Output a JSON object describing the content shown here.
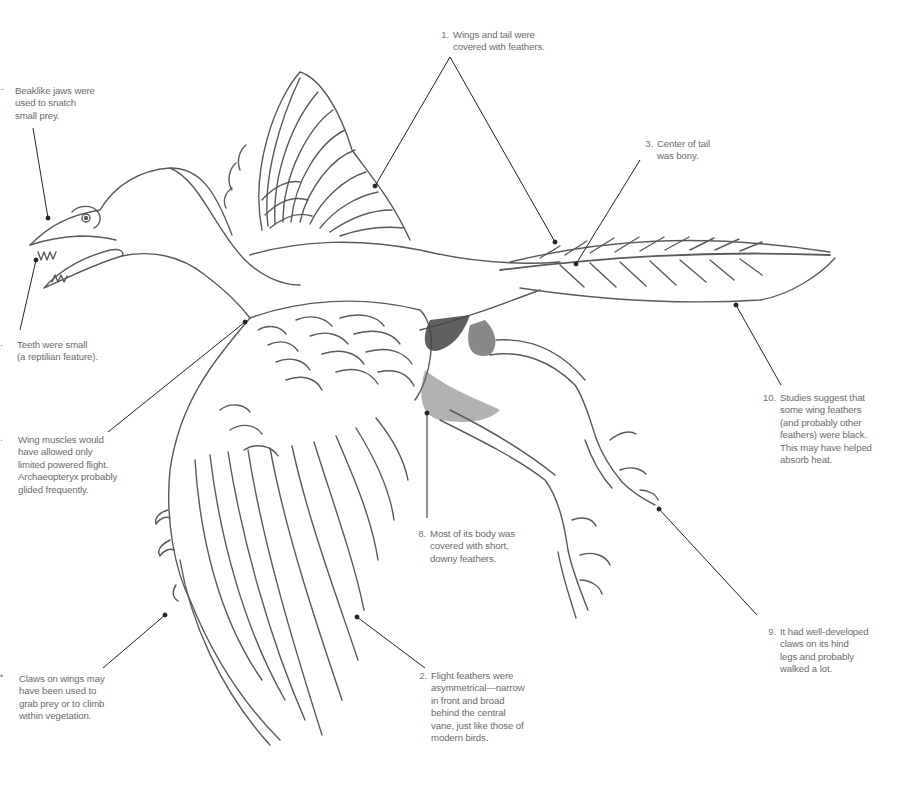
{
  "diagram": {
    "colors": {
      "background": "#ffffff",
      "text": "#6b6b6b",
      "leader_line": "#222222",
      "pencil": "#555555"
    },
    "annotations": [
      {
        "id": "a1",
        "number": "1.",
        "text": "Wings and tail were\ncovered with feathers.",
        "x": 453,
        "y": 29
      },
      {
        "id": "a2",
        "number": "2.",
        "text": "Flight feathers were\nasymmetrical—narrow\nin front and broad\nbehind the central\nvane, just like those of\nmodern birds.",
        "x": 431,
        "y": 670
      },
      {
        "id": "a3",
        "number": "3.",
        "text": "Center of tail\nwas bony.",
        "x": 657,
        "y": 138
      },
      {
        "id": "a4",
        "number": "",
        "text": "Beaklike jaws were\nused to snatch\nsmall prey.",
        "x": 15,
        "y": 85
      },
      {
        "id": "a5",
        "number": "",
        "text": "Teeth were small\n(a reptilian feature).",
        "x": 17,
        "y": 339
      },
      {
        "id": "a6",
        "number": "",
        "text": "Wing muscles would\nhave allowed only\nlimited powered flight.\nArchaeopteryx probably\nglided frequently.",
        "x": 18,
        "y": 434
      },
      {
        "id": "a7",
        "number": "",
        "text": "Claws on wings may\nhave been used to\ngrab prey or to climb\nwithin vegetation.",
        "x": 19,
        "y": 673
      },
      {
        "id": "a8",
        "number": "8.",
        "text": "Most of its body was\ncovered with short,\ndowny feathers.",
        "x": 430,
        "y": 528
      },
      {
        "id": "a9",
        "number": "9.",
        "text": "It had well-developed\nclaws on its hind\nlegs and probably\nwalked a lot.",
        "x": 780,
        "y": 626
      },
      {
        "id": "a10",
        "number": "10.",
        "text": "Studies suggest that\nsome wing feathers\n(and probably other\nfeathers) were black.\nThis may have helped\nabsorb heat.",
        "x": 780,
        "y": 392
      }
    ],
    "cropped_numbers": [
      {
        "id": "c4",
        "glyph": "-",
        "x": 1,
        "y": 86
      },
      {
        "id": "c5",
        "glyph": "․",
        "x": 0,
        "y": 340
      },
      {
        "id": "c6",
        "glyph": "․",
        "x": 0,
        "y": 435
      },
      {
        "id": "c7",
        "glyph": "•",
        "x": 0,
        "y": 673
      }
    ]
  }
}
